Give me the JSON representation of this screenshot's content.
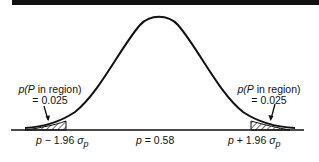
{
  "diagram": {
    "title": "",
    "type": "normal distribution with two-tailed rejection regions",
    "annotations": {
      "left": {
        "line1_prefix": "p(",
        "line1_var": "P",
        "line1_suffix": " in region)",
        "line2": "= 0.025"
      },
      "right": {
        "line1_prefix": "p(",
        "line1_var": "P",
        "line1_suffix": " in region)",
        "line2": "= 0.025"
      }
    },
    "axis_labels": {
      "left": {
        "var": "p",
        "mid": " − 1.96 ",
        "sigma": "σ",
        "sub": "p"
      },
      "center": {
        "var": "p",
        "rest": " = 0.58"
      },
      "right": {
        "var": "p",
        "mid": " + 1.96 ",
        "sigma": "σ",
        "sub": "p"
      }
    },
    "colors": {
      "line": "#111111",
      "background": "#ffffff"
    }
  }
}
